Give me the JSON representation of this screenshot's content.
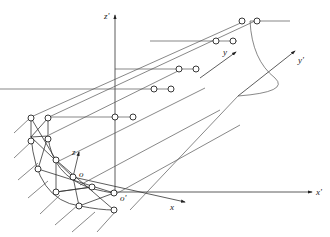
{
  "diagram": {
    "type": "axonometric structural projection",
    "axes": {
      "global": {
        "x": "x'",
        "y": "y'",
        "z": "z'",
        "origin": "o'"
      },
      "local": {
        "x": "x",
        "y": "y",
        "z": "z",
        "origin": "o"
      }
    },
    "colors": {
      "line": "#333333",
      "background": "#ffffff"
    }
  }
}
